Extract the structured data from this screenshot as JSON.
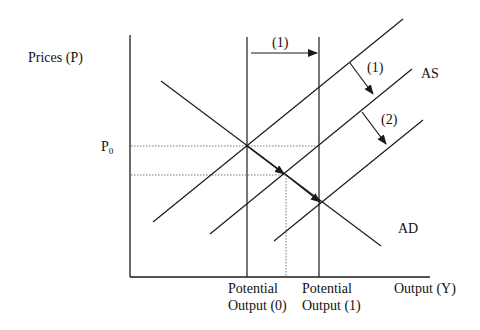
{
  "diagram": {
    "axes": {
      "y_label": "Prices (P)",
      "x_label": "Output (Y)",
      "price_marker": {
        "main": "P",
        "sub": "0"
      }
    },
    "x_ticks": [
      {
        "line1": "Potential",
        "line2": "Output (0)"
      },
      {
        "line1": "Potential",
        "line2": "Output (1)"
      }
    ],
    "curves": {
      "as_label": "AS",
      "ad_label": "AD"
    },
    "arrows": {
      "potential_shift_label": "(1)",
      "as_shift_1_label": "(1)",
      "as_shift_2_label": "(2)"
    },
    "colors": {
      "line": "#1a1a1a",
      "dotted": "#555555",
      "background": "#ffffff"
    }
  }
}
